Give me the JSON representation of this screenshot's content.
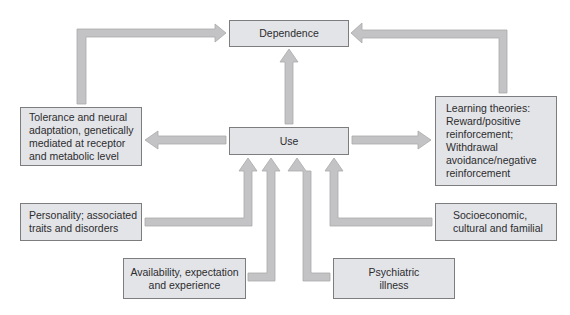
{
  "diagram": {
    "type": "flowchart",
    "colors": {
      "box_fill": "#e3e4e8",
      "box_border": "#7d7d80",
      "arrow_fill": "#c3c3c5",
      "arrow_stroke": "#a9a9ab",
      "text": "#2c2c2e"
    },
    "nodes": {
      "dependence": {
        "label": "Dependence"
      },
      "use": {
        "label": "Use"
      },
      "tolerance": {
        "label": "Tolerance and neural\nadaptation, genetically\nmediated at receptor\nand metabolic level"
      },
      "learning": {
        "label": "Learning theories:\nReward/positive\nreinforcement;\nWithdrawal\navoidance/negative\nreinforcement"
      },
      "personality": {
        "label": "Personality; associated\ntraits and disorders"
      },
      "socioeconomic": {
        "label": "Socioeconomic,\ncultural and familial"
      },
      "availability": {
        "label": "Availability, expectation\nand experience"
      },
      "psychiatric": {
        "label": "Psychiatric\nillness"
      }
    },
    "edges": [
      {
        "from": "use",
        "to": "dependence"
      },
      {
        "from": "use",
        "to": "tolerance"
      },
      {
        "from": "use",
        "to": "learning"
      },
      {
        "from": "tolerance",
        "to": "dependence"
      },
      {
        "from": "learning",
        "to": "dependence"
      },
      {
        "from": "personality",
        "to": "use"
      },
      {
        "from": "availability",
        "to": "use"
      },
      {
        "from": "psychiatric",
        "to": "use"
      },
      {
        "from": "socioeconomic",
        "to": "use"
      }
    ]
  }
}
